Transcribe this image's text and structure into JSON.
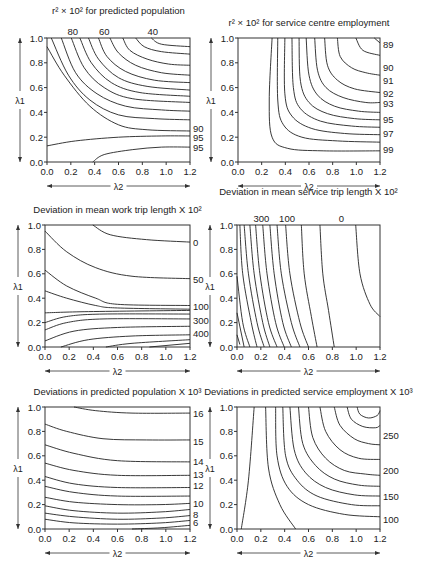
{
  "chart_data": [
    {
      "type": "contour",
      "title": "r² × 10² for predicted population",
      "xlabel": "λ2",
      "ylabel": "λ1",
      "xlim": [
        0,
        1.2
      ],
      "ylim": [
        0,
        1.0
      ],
      "xticks": [
        "0.0",
        "0.2",
        "0.4",
        "0.6",
        "0.8",
        "1.0",
        "1.2"
      ],
      "yticks": [
        "0.0",
        "0.2",
        "0.4",
        "0.6",
        "0.8",
        "1.0"
      ],
      "contour_labels_top": [
        "80",
        "60",
        "40"
      ],
      "contour_labels_right": [
        "90",
        "95",
        "95"
      ]
    },
    {
      "type": "contour",
      "title": "r² × 10² for service centre employment",
      "xlabel": "λ2",
      "ylabel": "λ1",
      "xlim": [
        0,
        1.2
      ],
      "ylim": [
        0,
        1.0
      ],
      "xticks": [
        "0.0",
        "0.2",
        "0.4",
        "0.6",
        "0.8",
        "1.0",
        "1.2"
      ],
      "yticks": [
        "0.0",
        "0.2",
        "0.4",
        "0.6",
        "0.8",
        "1.0"
      ],
      "contour_labels_right": [
        "89",
        "90",
        "91",
        "92",
        "93",
        "95",
        "97",
        "99"
      ]
    },
    {
      "type": "contour",
      "title": "Deviation in mean work trip length X 10²",
      "xlabel": "λ2",
      "ylabel": "λ1",
      "xlim": [
        0,
        1.2
      ],
      "ylim": [
        0,
        1.0
      ],
      "xticks": [
        "0.0",
        "0.2",
        "0.4",
        "0.6",
        "0.8",
        "1.0",
        "1.2"
      ],
      "yticks": [
        "0.0",
        "0.2",
        "0.4",
        "0.6",
        "0.8",
        "1.0"
      ],
      "contour_labels_right": [
        "0",
        "50",
        "100",
        "300",
        "400"
      ]
    },
    {
      "type": "contour",
      "title": "Deviation in mean service trip length X 10²",
      "xlabel": "λ2",
      "ylabel": "λ1",
      "xlim": [
        0,
        1.2
      ],
      "ylim": [
        0,
        1.0
      ],
      "xticks": [
        "0.0",
        "0.2",
        "0.4",
        "0.6",
        "0.8",
        "1.0",
        "1.2"
      ],
      "yticks": [
        "0.0",
        "0.2",
        "0.4",
        "0.6",
        "0.8",
        "1.0"
      ],
      "contour_labels_top": [
        "300",
        "100",
        "0"
      ]
    },
    {
      "type": "contour",
      "title": "Deviations in predicted population X 10³",
      "xlabel": "λ2",
      "ylabel": "λ1",
      "xlim": [
        0,
        1.2
      ],
      "ylim": [
        0,
        1.0
      ],
      "xticks": [
        "0.0",
        "0.2",
        "0.4",
        "0.6",
        "0.8",
        "1.0",
        "1.2"
      ],
      "yticks": [
        "0.0",
        "0.2",
        "0.4",
        "0.6",
        "0.8",
        "1.0"
      ],
      "contour_labels_right": [
        "16",
        "15",
        "14",
        "13",
        "12",
        "10",
        "8",
        "6"
      ]
    },
    {
      "type": "contour",
      "title": "Deviations in predicted service employment X 10³",
      "xlabel": "λ2",
      "ylabel": "λ1",
      "xlim": [
        0,
        1.2
      ],
      "ylim": [
        0,
        1.0
      ],
      "xticks": [
        "0.0",
        "0.2",
        "0.4",
        "0.6",
        "0.8",
        "1.0",
        "1.2"
      ],
      "yticks": [
        "0.0",
        "0.2",
        "0.4",
        "0.6",
        "0.8",
        "1.0"
      ],
      "contour_labels_right": [
        "250",
        "200",
        "150",
        "100"
      ]
    }
  ]
}
